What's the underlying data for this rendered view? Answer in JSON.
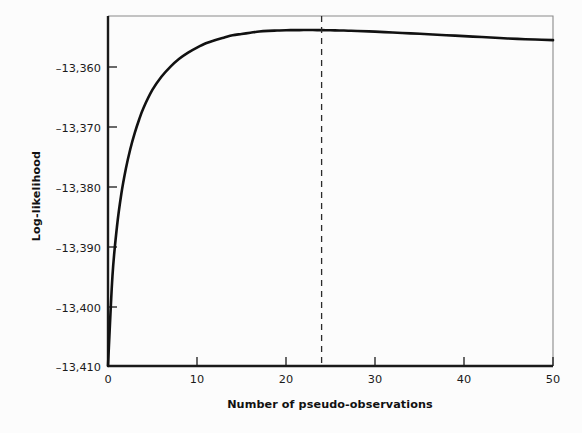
{
  "chart_data": {
    "type": "line",
    "title": "",
    "xlabel": "Number of pseudo-observations",
    "ylabel": "Log-likelihood",
    "xlim": [
      0,
      50
    ],
    "ylim": [
      -13410,
      -13353.5
    ],
    "xticks": [
      0,
      10,
      20,
      30,
      40,
      50
    ],
    "xticklabels": [
      "0",
      "10",
      "20",
      "30",
      "40",
      "50"
    ],
    "yticks": [
      -13360,
      -13370,
      -13380,
      -13390,
      -13400,
      -13410
    ],
    "yticklabels": [
      "–13,360",
      "–13,370",
      "–13,380",
      "–13,390",
      "–13,400",
      "–13,410"
    ],
    "grid": false,
    "legend": null,
    "series": [
      {
        "name": "Log-likelihood",
        "color": "#111111",
        "x": [
          0,
          0.5,
          1,
          1.5,
          2,
          2.5,
          3,
          3.5,
          4,
          5,
          6,
          7,
          8,
          9,
          10,
          11,
          12,
          13,
          14,
          15,
          16,
          17,
          18,
          19,
          20,
          21,
          22,
          23,
          24,
          25,
          26,
          27,
          28,
          30,
          32,
          34,
          36,
          38,
          40,
          42,
          44,
          46,
          48,
          50
        ],
        "y": [
          -13410.0,
          -13395.5,
          -13387.6,
          -13382.2,
          -13378.2,
          -13375.0,
          -13372.4,
          -13370.2,
          -13368.3,
          -13365.4,
          -13363.3,
          -13361.7,
          -13360.4,
          -13359.4,
          -13358.6,
          -13357.9,
          -13357.4,
          -13357.0,
          -13356.6,
          -13356.4,
          -13356.2,
          -13356.0,
          -13355.9,
          -13355.85,
          -13355.8,
          -13355.78,
          -13355.77,
          -13355.77,
          -13355.78,
          -13355.8,
          -13355.83,
          -13355.87,
          -13355.92,
          -13356.03,
          -13356.16,
          -13356.3,
          -13356.45,
          -13356.6,
          -13356.75,
          -13356.9,
          -13357.05,
          -13357.2,
          -13357.3,
          -13357.4
        ]
      }
    ],
    "annotations": [
      {
        "name": "optimum-vertical-line",
        "type": "vline",
        "x": 24,
        "style": "dashed",
        "color": "#2b2b2b",
        "label": ""
      }
    ]
  },
  "plot": {
    "left_px": 108,
    "right_px": 553,
    "top_px": 16,
    "bottom_px": 366
  }
}
